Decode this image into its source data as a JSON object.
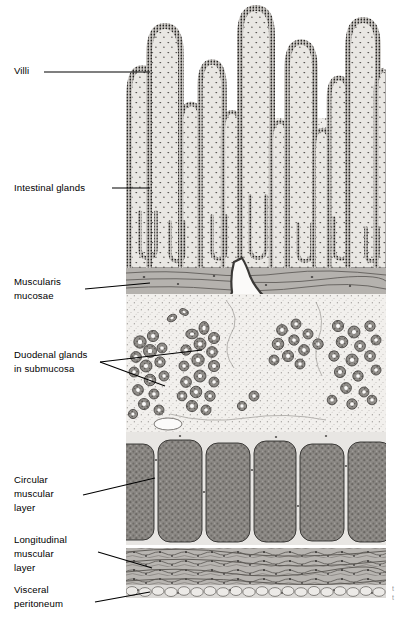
{
  "figure": {
    "background_color": "#ffffff",
    "ink_color": "#000000"
  },
  "labels": [
    {
      "id": "villi",
      "text": "Villi",
      "x": 14,
      "y": 64,
      "leader": {
        "type": "straight",
        "from": [
          44,
          72
        ],
        "to": [
          150,
          72
        ]
      }
    },
    {
      "id": "intestinal-glands",
      "text": "Intestinal glands",
      "x": 14,
      "y": 181,
      "leader": {
        "type": "straight",
        "from": [
          112,
          188
        ],
        "to": [
          150,
          188
        ]
      }
    },
    {
      "id": "muscularis-mucosae",
      "text": "Muscularis\nmucosae",
      "x": 14,
      "y": 275,
      "leader": {
        "type": "straight",
        "from": [
          85,
          289
        ],
        "to": [
          150,
          283
        ]
      }
    },
    {
      "id": "duodenal-glands",
      "text": "Duodenal glands\nin submucosa",
      "x": 14,
      "y": 348,
      "leader": {
        "type": "branched",
        "origin": [
          100,
          362
        ],
        "tips": [
          [
            202,
            350
          ],
          [
            165,
            386
          ]
        ]
      }
    },
    {
      "id": "circular-muscular-layer",
      "text": "Circular\nmuscular\nlayer",
      "x": 14,
      "y": 473,
      "leader": {
        "type": "straight",
        "from": [
          83,
          495
        ],
        "to": [
          155,
          478
        ]
      }
    },
    {
      "id": "longitudinal-muscular-layer",
      "text": "Longitudinal\nmuscular\nlayer",
      "x": 14,
      "y": 533,
      "leader": {
        "type": "straight",
        "from": [
          98,
          552
        ],
        "to": [
          152,
          568
        ]
      }
    },
    {
      "id": "visceral-peritoneum",
      "text": "Visceral\nperitoneum",
      "x": 14,
      "y": 583,
      "leader": {
        "type": "straight",
        "from": [
          95,
          602
        ],
        "to": [
          150,
          592
        ]
      }
    }
  ],
  "layers": [
    {
      "id": "villi",
      "name": "Villi",
      "top": 0,
      "bottom": 262
    },
    {
      "id": "intestinal-glands",
      "name": "Intestinal glands",
      "top": 130,
      "bottom": 268
    },
    {
      "id": "muscularis-mucosae",
      "name": "Muscularis mucosae",
      "top": 268,
      "bottom": 296
    },
    {
      "id": "submucosa",
      "name": "Submucosa with duodenal glands",
      "top": 296,
      "bottom": 432
    },
    {
      "id": "circular-muscle",
      "name": "Circular muscular layer",
      "top": 432,
      "bottom": 545
    },
    {
      "id": "longitudinal-muscle",
      "name": "Longitudinal muscular layer",
      "top": 545,
      "bottom": 586
    },
    {
      "id": "peritoneum",
      "name": "Visceral peritoneum",
      "top": 586,
      "bottom": 600
    }
  ],
  "illustration": {
    "x": 126,
    "y": 0,
    "width": 260,
    "height": 600,
    "tone_light": "#eeece9",
    "tone_mid": "#c9c6c2",
    "tone_dark": "#7e7b78",
    "tone_darkest": "#3d3b39",
    "villi_count": 14,
    "circular_bundle_count": 6,
    "gland_cluster_count": 7
  },
  "caption_fragment": {
    "line1": "t",
    "line2": "t"
  }
}
